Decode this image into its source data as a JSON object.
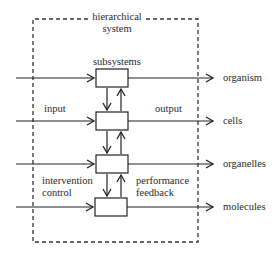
{
  "diagram": {
    "container_label_line1": "hierarchical",
    "container_label_line2": "system",
    "box_header": "subsystems",
    "levels": [
      {
        "label": "organism"
      },
      {
        "label": "cells"
      },
      {
        "label": "organelles"
      },
      {
        "label": "molecules"
      }
    ],
    "annotations": {
      "input": "input",
      "output": "output",
      "intervention_line1": "intervention",
      "intervention_line2": "control",
      "performance_line1": "performance",
      "performance_line2": "feedback"
    },
    "colors": {
      "stroke": "#222222",
      "background": "#ffffff"
    }
  }
}
